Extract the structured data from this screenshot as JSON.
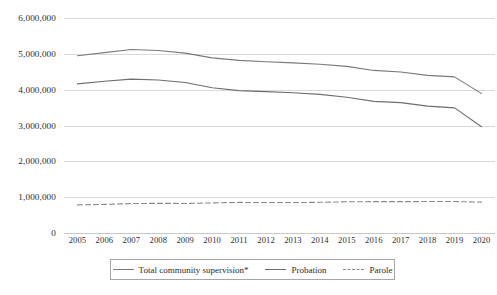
{
  "chart_data": {
    "type": "line",
    "title": "",
    "subtitle": "",
    "xlabel": "",
    "ylabel": "",
    "x": [
      2005,
      2006,
      2007,
      2008,
      2009,
      2010,
      2011,
      2012,
      2013,
      2014,
      2015,
      2016,
      2017,
      2018,
      2019,
      2020
    ],
    "categories": [
      "2005",
      "2006",
      "2007",
      "2008",
      "2009",
      "2010",
      "2011",
      "2012",
      "2013",
      "2014",
      "2015",
      "2016",
      "2017",
      "2018",
      "2019",
      "2020"
    ],
    "ylim": [
      0,
      6000000
    ],
    "ytick_labels": [
      "0",
      "1,000,000",
      "2,000,000",
      "3,000,000",
      "4,000,000",
      "5,000,000",
      "6,000,000"
    ],
    "ytick_values": [
      0,
      1000000,
      2000000,
      3000000,
      4000000,
      5000000,
      6000000
    ],
    "grid": true,
    "legend_position": "bottom",
    "series": [
      {
        "name": "Total community supervision*",
        "style": "solid",
        "color": "#7a7a7a",
        "values": [
          4946600,
          5035000,
          5119000,
          5093000,
          5019000,
          4888000,
          4818000,
          4781000,
          4749000,
          4708000,
          4650000,
          4537000,
          4494000,
          4399000,
          4357000,
          3890000
        ]
      },
      {
        "name": "Probation",
        "style": "solid",
        "color": "#6e6e6e",
        "values": [
          4162500,
          4236800,
          4293000,
          4271000,
          4199000,
          4055000,
          3973000,
          3944000,
          3912000,
          3868000,
          3790000,
          3673000,
          3639000,
          3540000,
          3492000,
          2964000
        ]
      },
      {
        "name": "Parole",
        "style": "dashed",
        "color": "#8a8a8a",
        "values": [
          784400,
          798200,
          821000,
          828000,
          824000,
          840000,
          854000,
          851000,
          849000,
          857000,
          871000,
          875000,
          875000,
          878000,
          878000,
          862000
        ]
      }
    ]
  },
  "legend": {
    "items": [
      {
        "label": "Total community supervision*",
        "style": "solid"
      },
      {
        "label": "Probation",
        "style": "solid-dark"
      },
      {
        "label": "Parole",
        "style": "dashed"
      }
    ]
  }
}
